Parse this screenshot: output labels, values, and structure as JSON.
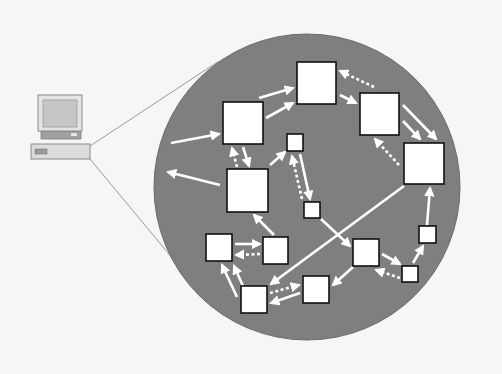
{
  "diagram": {
    "colors": {
      "background": "#f6f6f6",
      "circle_fill": "#7f7f7f",
      "circle_stroke": "#6a6a6a",
      "node_fill": "#ffffff",
      "node_stroke": "#111111",
      "arrow": "#ffffff",
      "zoom_lines": "#9a9a9a"
    },
    "computer": {
      "icon": "desktop-computer-icon",
      "monitor": {
        "x": 38,
        "y": 95,
        "w": 44,
        "h": 36
      },
      "screen": {
        "x": 43,
        "y": 100,
        "w": 34,
        "h": 27
      },
      "stand": {
        "x": 41,
        "y": 131,
        "w": 40,
        "h": 8
      },
      "unit": {
        "x": 31,
        "y": 144,
        "w": 59,
        "h": 15
      }
    },
    "zoom_lines": [
      {
        "x1": 90,
        "y1": 146,
        "x2": 219,
        "y2": 61
      },
      {
        "x1": 90,
        "y1": 159,
        "x2": 183,
        "y2": 271
      }
    ],
    "circle": {
      "cx": 307,
      "cy": 187,
      "r": 153
    },
    "nodes": [
      {
        "id": "A",
        "x": 223,
        "y": 102,
        "w": 40,
        "h": 42
      },
      {
        "id": "B",
        "x": 297,
        "y": 62,
        "w": 39,
        "h": 42
      },
      {
        "id": "C",
        "x": 360,
        "y": 93,
        "w": 39,
        "h": 42
      },
      {
        "id": "D",
        "x": 404,
        "y": 143,
        "w": 40,
        "h": 41
      },
      {
        "id": "E",
        "x": 227,
        "y": 169,
        "w": 41,
        "h": 43
      },
      {
        "id": "F",
        "x": 287,
        "y": 134,
        "w": 16,
        "h": 17
      },
      {
        "id": "G",
        "x": 304,
        "y": 202,
        "w": 16,
        "h": 16
      },
      {
        "id": "H",
        "x": 206,
        "y": 234,
        "w": 26,
        "h": 27
      },
      {
        "id": "I",
        "x": 263,
        "y": 237,
        "w": 25,
        "h": 27
      },
      {
        "id": "J",
        "x": 353,
        "y": 239,
        "w": 26,
        "h": 27
      },
      {
        "id": "K",
        "x": 419,
        "y": 226,
        "w": 17,
        "h": 17
      },
      {
        "id": "L",
        "x": 402,
        "y": 266,
        "w": 16,
        "h": 16
      },
      {
        "id": "M",
        "x": 303,
        "y": 276,
        "w": 26,
        "h": 27
      },
      {
        "id": "N",
        "x": 241,
        "y": 286,
        "w": 26,
        "h": 27
      }
    ],
    "arrows": [
      {
        "from": "outside",
        "to": "A",
        "x1": 171,
        "y1": 143,
        "x2": 219,
        "y2": 134,
        "dashed": false
      },
      {
        "from": "E",
        "to": "outside",
        "x1": 220,
        "y1": 185,
        "x2": 168,
        "y2": 172,
        "dashed": false
      },
      {
        "from": "A",
        "to": "E",
        "x1": 243,
        "y1": 147,
        "x2": 249,
        "y2": 166,
        "dashed": false
      },
      {
        "from": "E",
        "to": "A",
        "x1": 237,
        "y1": 167,
        "x2": 232,
        "y2": 148,
        "dashed": true
      },
      {
        "from": "A",
        "to": "B",
        "x1": 259,
        "y1": 98,
        "x2": 293,
        "y2": 88,
        "dashed": false
      },
      {
        "from": "A",
        "to": "B",
        "x1": 266,
        "y1": 118,
        "x2": 293,
        "y2": 103,
        "dashed": false
      },
      {
        "from": "B",
        "to": "C",
        "x1": 340,
        "y1": 95,
        "x2": 356,
        "y2": 103,
        "dashed": false
      },
      {
        "from": "C",
        "to": "B",
        "x1": 374,
        "y1": 87,
        "x2": 340,
        "y2": 71,
        "dashed": true
      },
      {
        "from": "C",
        "to": "D",
        "x1": 403,
        "y1": 105,
        "x2": 436,
        "y2": 139,
        "dashed": false
      },
      {
        "from": "C",
        "to": "D",
        "x1": 403,
        "y1": 121,
        "x2": 420,
        "y2": 139,
        "dashed": false
      },
      {
        "from": "D",
        "to": "C",
        "x1": 399,
        "y1": 165,
        "x2": 375,
        "y2": 139,
        "dashed": true
      },
      {
        "from": "E",
        "to": "F",
        "x1": 270,
        "y1": 165,
        "x2": 285,
        "y2": 152,
        "dashed": false
      },
      {
        "from": "F",
        "to": "G",
        "x1": 300,
        "y1": 154,
        "x2": 310,
        "y2": 199,
        "dashed": false
      },
      {
        "from": "G",
        "to": "F",
        "x1": 302,
        "y1": 199,
        "x2": 292,
        "y2": 156,
        "dashed": true
      },
      {
        "from": "G",
        "to": "J",
        "x1": 321,
        "y1": 219,
        "x2": 350,
        "y2": 246,
        "dashed": false
      },
      {
        "from": "D",
        "to": "N",
        "x1": 404,
        "y1": 186,
        "x2": 271,
        "y2": 284,
        "dashed": false
      },
      {
        "from": "I",
        "to": "E",
        "x1": 274,
        "y1": 235,
        "x2": 254,
        "y2": 215,
        "dashed": false
      },
      {
        "from": "H",
        "to": "I",
        "x1": 235,
        "y1": 244,
        "x2": 260,
        "y2": 244,
        "dashed": false
      },
      {
        "from": "I",
        "to": "H",
        "x1": 260,
        "y1": 254,
        "x2": 236,
        "y2": 255,
        "dashed": true
      },
      {
        "from": "N",
        "to": "H",
        "x1": 237,
        "y1": 297,
        "x2": 222,
        "y2": 265,
        "dashed": false
      },
      {
        "from": "N",
        "to": "H",
        "x1": 243,
        "y1": 286,
        "x2": 234,
        "y2": 266,
        "dashed": false
      },
      {
        "from": "N",
        "to": "M",
        "x1": 270,
        "y1": 293,
        "x2": 299,
        "y2": 285,
        "dashed": true
      },
      {
        "from": "M",
        "to": "N",
        "x1": 300,
        "y1": 293,
        "x2": 271,
        "y2": 303,
        "dashed": false
      },
      {
        "from": "J",
        "to": "M",
        "x1": 353,
        "y1": 267,
        "x2": 333,
        "y2": 285,
        "dashed": false
      },
      {
        "from": "J",
        "to": "L",
        "x1": 382,
        "y1": 254,
        "x2": 400,
        "y2": 264,
        "dashed": false
      },
      {
        "from": "L",
        "to": "J",
        "x1": 400,
        "y1": 278,
        "x2": 376,
        "y2": 270,
        "dashed": true
      },
      {
        "from": "L",
        "to": "K",
        "x1": 413,
        "y1": 263,
        "x2": 423,
        "y2": 246,
        "dashed": false
      },
      {
        "from": "K",
        "to": "D",
        "x1": 427,
        "y1": 225,
        "x2": 430,
        "y2": 188,
        "dashed": false
      }
    ]
  }
}
